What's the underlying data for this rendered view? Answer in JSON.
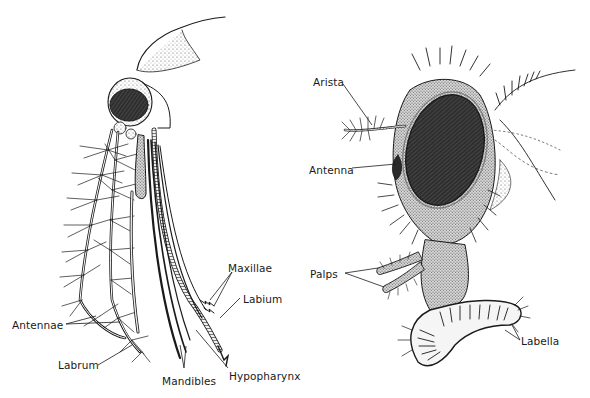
{
  "figure": {
    "left_panel": {
      "subject": "mosquito-head-piercing-mouthparts",
      "labels": {
        "maxillae": "Maxillae",
        "labium": "Labium",
        "antennae": "Antennae",
        "labrum": "Labrum",
        "mandibles": "Mandibles",
        "hypopharynx": "Hypopharynx"
      }
    },
    "right_panel": {
      "subject": "housefly-head-sponging-mouthparts",
      "labels": {
        "arista": "Arista",
        "antenna": "Antenna",
        "palps": "Palps",
        "labella": "Labella"
      }
    },
    "colors": {
      "ink": "#1a1a1a",
      "background": "#ffffff",
      "eye_fill": "#3a3a3a",
      "stipple": "#8a8a8a"
    }
  }
}
